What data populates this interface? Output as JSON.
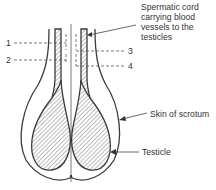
{
  "diagram": {
    "colors": {
      "line": "#3a3a3a",
      "text": "#333333",
      "background": "#ffffff"
    },
    "labels": {
      "spermatic_cord": [
        "Spermatic cord",
        "carrying blood",
        "vessels to the",
        "testicles"
      ],
      "skin_of_scrotum": "Skin of scrotum",
      "testicle": "Testicle"
    },
    "numbered_markers": [
      {
        "id": "1",
        "side": "left"
      },
      {
        "id": "2",
        "side": "left"
      },
      {
        "id": "3",
        "side": "right"
      },
      {
        "id": "4",
        "side": "right"
      }
    ]
  }
}
